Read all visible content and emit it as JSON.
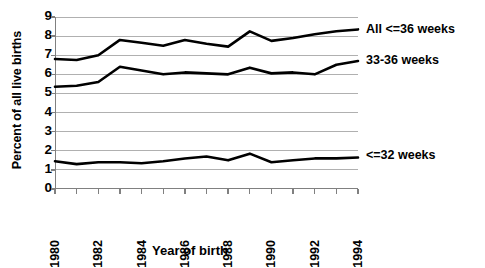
{
  "chart_data": {
    "type": "line",
    "title": "",
    "xlabel": "Year of birth",
    "ylabel": "Percent of all live births",
    "xlim": [
      1980,
      1994
    ],
    "ylim": [
      0,
      9
    ],
    "yticks": [
      0,
      1,
      2,
      3,
      4,
      5,
      6,
      7,
      8,
      9
    ],
    "xticks": [
      1980,
      1981,
      1982,
      1983,
      1984,
      1985,
      1986,
      1987,
      1988,
      1989,
      1990,
      1991,
      1992,
      1993,
      1994
    ],
    "xtick_labels": [
      "1980",
      "",
      "1982",
      "",
      "1984",
      "",
      "1986",
      "",
      "1988",
      "",
      "1990",
      "",
      "1992",
      "",
      "1994"
    ],
    "grid": true,
    "grid_axis": "y",
    "legend_position": "right-inline",
    "x": [
      1980,
      1981,
      1982,
      1983,
      1984,
      1985,
      1986,
      1987,
      1988,
      1989,
      1990,
      1991,
      1992,
      1993,
      1994
    ],
    "series": [
      {
        "name": "All <=36 weeks",
        "label_y_value": 8.3,
        "values": [
          6.8,
          6.75,
          7.0,
          7.8,
          7.65,
          7.5,
          7.8,
          7.6,
          7.45,
          8.25,
          7.75,
          7.9,
          8.1,
          8.25,
          8.35
        ]
      },
      {
        "name": "33-36 weeks",
        "label_y_value": 6.7,
        "values": [
          5.35,
          5.4,
          5.6,
          6.4,
          6.2,
          6.0,
          6.1,
          6.05,
          6.0,
          6.35,
          6.05,
          6.1,
          6.0,
          6.5,
          6.7
        ]
      },
      {
        "name": "<=32 weeks",
        "label_y_value": 1.75,
        "values": [
          1.45,
          1.3,
          1.4,
          1.4,
          1.35,
          1.45,
          1.6,
          1.7,
          1.5,
          1.85,
          1.4,
          1.5,
          1.6,
          1.6,
          1.65
        ]
      }
    ],
    "colors": {
      "line": "#000000",
      "grid": "#b0b0b0",
      "axis": "#808080",
      "background": "#ffffff"
    }
  }
}
